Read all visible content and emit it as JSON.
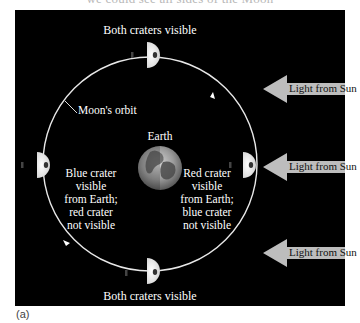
{
  "top_caption": "we could see all sides of the Moon",
  "figure_label": "(a)",
  "labels": {
    "top_moon": "Both craters visible",
    "bottom_moon": "Both craters visible",
    "orbit": "Moon's orbit",
    "earth": "Earth",
    "left_text": [
      "Blue crater",
      "visible",
      "from Earth;",
      "red crater",
      "not visible"
    ],
    "right_text": [
      "Red crater",
      "visible",
      "from Earth;",
      "blue crater",
      "not visible"
    ]
  },
  "sun_arrows": [
    {
      "label": "Light from Sun"
    },
    {
      "label": "Light from Sun"
    },
    {
      "label": "Light from Sun"
    }
  ],
  "colors": {
    "background": "#000000",
    "orbit": "#e8e8e8",
    "arrow_fill": "#bdbdbd",
    "text": "#ffffff"
  }
}
